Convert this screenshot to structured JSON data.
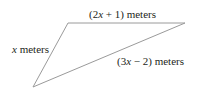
{
  "diagram": {
    "type": "triangle",
    "vertices": {
      "top_left": [
        68,
        23
      ],
      "top_right": [
        185,
        23
      ],
      "bottom": [
        33,
        87
      ]
    },
    "sides": [
      {
        "name": "top",
        "label_var": "x",
        "label_pre": "(2",
        "label_post": " + 1) meters"
      },
      {
        "name": "left",
        "label_var": "x",
        "label_pre": "",
        "label_post": " meters"
      },
      {
        "name": "diagonal",
        "label_var": "x",
        "label_pre": "(3",
        "label_post": " − 2) meters"
      }
    ],
    "stroke_color": "#9a9a9a",
    "text_color": "#231f20"
  }
}
